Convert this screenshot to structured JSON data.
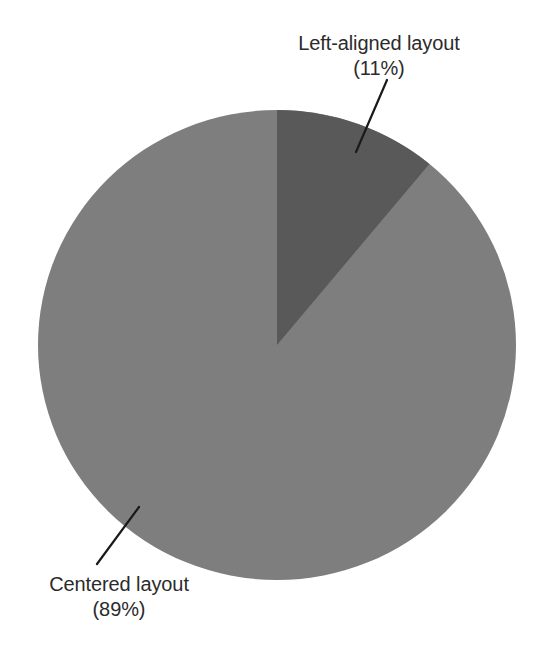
{
  "chart_data": {
    "type": "pie",
    "title": "",
    "labels": [
      "Left-aligned layout",
      "Centered layout"
    ],
    "values": [
      11,
      89
    ],
    "value_unit": "%",
    "slices": [
      {
        "name": "Left-aligned layout",
        "percent": 11,
        "percent_label": "(11%)",
        "color": "#59595a",
        "start_angle_deg": 0,
        "end_angle_deg": 39.6
      },
      {
        "name": "Centered layout",
        "percent": 89,
        "percent_label": "(89%)",
        "color": "#7e7e7e",
        "start_angle_deg": 39.6,
        "end_angle_deg": 360
      }
    ],
    "legend": "callout-labels",
    "start_angle_note": "first slice begins at 12 o'clock, drawn clockwise",
    "grid": false
  },
  "geometry": {
    "center_x": 277,
    "center_y": 345,
    "radius_x": 239,
    "radius_y": 235
  },
  "callouts": {
    "left_aligned": {
      "name": "Left-aligned layout",
      "percent": "(11%)",
      "leader": {
        "x1": 387,
        "y1": 80,
        "x2": 356,
        "y2": 152
      }
    },
    "centered": {
      "name": "Centered layout",
      "percent": "(89%)",
      "leader": {
        "x1": 139,
        "y1": 507,
        "x2": 97,
        "y2": 564
      }
    }
  },
  "colors": {
    "background": "#ffffff",
    "slice_dark": "#59595a",
    "slice_light": "#7e7e7e",
    "text": "#2b2b2b",
    "leader_line": "#1a1a1a"
  }
}
